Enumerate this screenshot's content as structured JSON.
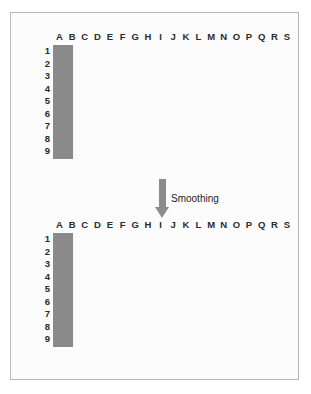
{
  "figure": {
    "arrow_label": "Smoothing",
    "arrow_icon": "down-arrow-icon",
    "frame_border_color": "#b9b9b9",
    "background_color": "#fcfcfc"
  },
  "grid_spec": {
    "columns": [
      "A",
      "B",
      "C",
      "D",
      "E",
      "F",
      "G",
      "H",
      "I",
      "J",
      "K",
      "L",
      "M",
      "N",
      "O",
      "P",
      "Q",
      "R",
      "S"
    ],
    "rows": [
      "1",
      "2",
      "3",
      "4",
      "5",
      "6",
      "7",
      "8",
      "9"
    ],
    "cell_empty_color": "#ffffff",
    "cell_filled_color": "#6e6e6e",
    "grid_line_color": "#8a8a8a",
    "grid_border_color": "#6d6d6d"
  },
  "chart_data": {
    "type": "heatmap",
    "title": "Smoothing",
    "xlabel": "",
    "ylabel": "",
    "categories": [
      "A",
      "B",
      "C",
      "D",
      "E",
      "F",
      "G",
      "H",
      "I",
      "J",
      "K",
      "L",
      "M",
      "N",
      "O",
      "P",
      "Q",
      "R",
      "S"
    ],
    "rows": [
      "1",
      "2",
      "3",
      "4",
      "5",
      "6",
      "7",
      "8",
      "9"
    ],
    "legend": [],
    "grid": true,
    "panels": [
      {
        "name": "original-point-pattern",
        "position": "top",
        "description": "Binary grid: filled cells are occupied points",
        "value_range": [
          0,
          1
        ],
        "filled_cells": [
          "D2",
          "E2",
          "C3",
          "D3",
          "C4",
          "E4",
          "G4",
          "C5",
          "E5",
          "L8"
        ],
        "values": [
          [
            0,
            0,
            0,
            0,
            0,
            0,
            0,
            0,
            0,
            0,
            0,
            0,
            0,
            0,
            0,
            0,
            0,
            0,
            0
          ],
          [
            0,
            0,
            0,
            1,
            1,
            0,
            0,
            0,
            0,
            0,
            0,
            0,
            0,
            0,
            0,
            0,
            0,
            0,
            0
          ],
          [
            0,
            0,
            1,
            1,
            0,
            0,
            0,
            0,
            0,
            0,
            0,
            0,
            0,
            0,
            0,
            0,
            0,
            0,
            0
          ],
          [
            0,
            0,
            1,
            0,
            1,
            0,
            1,
            0,
            0,
            0,
            0,
            0,
            0,
            0,
            0,
            0,
            0,
            0,
            0
          ],
          [
            0,
            0,
            1,
            0,
            1,
            0,
            0,
            0,
            0,
            0,
            0,
            0,
            0,
            0,
            0,
            0,
            0,
            0,
            0
          ],
          [
            0,
            0,
            0,
            0,
            0,
            0,
            0,
            0,
            0,
            0,
            0,
            0,
            0,
            0,
            0,
            0,
            0,
            0,
            0
          ],
          [
            0,
            0,
            0,
            0,
            0,
            0,
            0,
            0,
            0,
            0,
            0,
            0,
            0,
            0,
            0,
            0,
            0,
            0,
            0
          ],
          [
            0,
            0,
            0,
            0,
            0,
            0,
            0,
            0,
            0,
            0,
            0,
            1,
            0,
            0,
            0,
            0,
            0,
            0,
            0
          ],
          [
            0,
            0,
            0,
            0,
            0,
            0,
            0,
            0,
            0,
            0,
            0,
            0,
            0,
            0,
            0,
            0,
            0,
            0,
            0
          ]
        ]
      },
      {
        "name": "smoothed-intensity-surface",
        "position": "bottom",
        "description": "Continuous intensity after kernel smoothing; 0 = white, 1 = darkest gray",
        "value_range": [
          0,
          1
        ],
        "values": [
          [
            0,
            0.1,
            0.22,
            0.3,
            0.25,
            0.12,
            0.02,
            0,
            0,
            0,
            0,
            0,
            0,
            0,
            0,
            0,
            0,
            0,
            0
          ],
          [
            0,
            0.18,
            0.4,
            0.78,
            0.72,
            0.28,
            0.06,
            0,
            0,
            0,
            0,
            0,
            0,
            0,
            0,
            0,
            0,
            0,
            0
          ],
          [
            0,
            0.22,
            0.62,
            0.88,
            0.5,
            0.22,
            0.12,
            0.08,
            0,
            0,
            0,
            0,
            0,
            0,
            0,
            0,
            0,
            0,
            0
          ],
          [
            0,
            0.2,
            0.58,
            0.82,
            0.55,
            0.3,
            0.34,
            0.12,
            0,
            0,
            0,
            0,
            0,
            0,
            0,
            0,
            0,
            0,
            0
          ],
          [
            0,
            0.18,
            0.52,
            0.38,
            0.6,
            0.22,
            0.08,
            0.03,
            0,
            0,
            0,
            0,
            0,
            0,
            0,
            0,
            0,
            0,
            0
          ],
          [
            0,
            0.08,
            0.22,
            0.24,
            0.24,
            0.12,
            0.03,
            0,
            0,
            0,
            0,
            0,
            0,
            0,
            0,
            0,
            0,
            0,
            0
          ],
          [
            0,
            0,
            0.04,
            0.05,
            0.05,
            0.02,
            0,
            0,
            0,
            0,
            0,
            0.1,
            0.12,
            0.08,
            0,
            0,
            0,
            0,
            0
          ],
          [
            0,
            0,
            0,
            0,
            0,
            0,
            0,
            0,
            0,
            0,
            0,
            0.14,
            0.34,
            0.14,
            0,
            0,
            0,
            0,
            0
          ],
          [
            0,
            0,
            0,
            0,
            0,
            0,
            0,
            0,
            0,
            0,
            0,
            0.1,
            0.12,
            0.08,
            0,
            0,
            0,
            0,
            0
          ]
        ]
      }
    ]
  }
}
